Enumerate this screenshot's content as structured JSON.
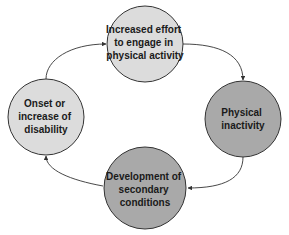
{
  "diagram": {
    "type": "cycle",
    "nodes": [
      {
        "id": "effort",
        "lines": [
          "Increased effort",
          "to engage in",
          "physical activity"
        ],
        "fill": "#dcdcdc",
        "cx": 145,
        "cy": 44,
        "r": 38
      },
      {
        "id": "inactivity",
        "lines": [
          "Physical",
          "inactivity"
        ],
        "fill": "#a9a9a9",
        "cx": 243,
        "cy": 119,
        "r": 38
      },
      {
        "id": "secondary",
        "lines": [
          "Development of",
          "secondary",
          "conditions"
        ],
        "fill": "#a9a9a9",
        "cx": 145,
        "cy": 188,
        "r": 41
      },
      {
        "id": "disability",
        "lines": [
          "Onset or",
          "increase of",
          "disability"
        ],
        "fill": "#dcdcdc",
        "cx": 46,
        "cy": 117,
        "r": 38
      }
    ],
    "edges": [
      {
        "from": "effort",
        "to": "inactivity"
      },
      {
        "from": "inactivity",
        "to": "secondary"
      },
      {
        "from": "secondary",
        "to": "disability"
      },
      {
        "from": "disability",
        "to": "effort"
      }
    ],
    "stroke_color": "#333333"
  }
}
